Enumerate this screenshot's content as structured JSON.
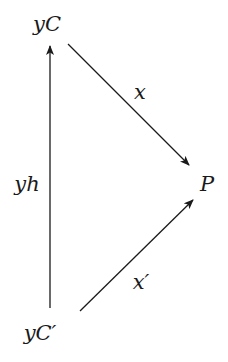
{
  "diagram": {
    "type": "commutative-diagram",
    "colors": {
      "stroke": "#1a1a1a",
      "background": "#ffffff"
    },
    "nodes": {
      "top": {
        "label": "yC"
      },
      "right": {
        "label": "P"
      },
      "bottom": {
        "label": "yC′"
      }
    },
    "edges": {
      "vertical": {
        "label": "yh",
        "from": "yC′",
        "to": "yC"
      },
      "upper_diagonal": {
        "label": "x",
        "from": "yC",
        "to": "P"
      },
      "lower_diagonal": {
        "label": "x′",
        "from": "yC′",
        "to": "P"
      }
    }
  }
}
